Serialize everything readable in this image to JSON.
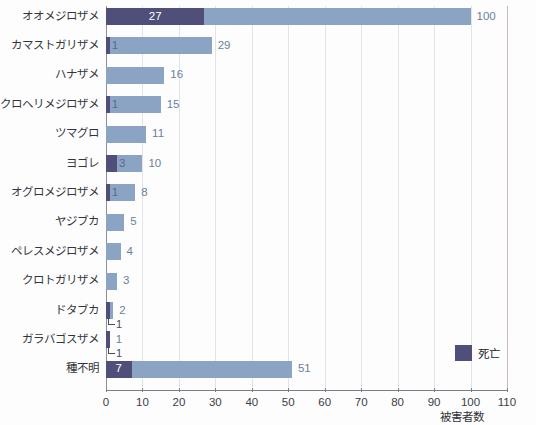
{
  "chart_data": {
    "type": "bar",
    "orientation": "horizontal",
    "stacked_overlay": true,
    "title": "",
    "subtitle": "",
    "xlabel": "被害者数",
    "ylabel": "",
    "xlim": [
      0,
      110
    ],
    "xticks": [
      0,
      10,
      20,
      30,
      40,
      50,
      60,
      70,
      80,
      90,
      100,
      110
    ],
    "xtick_labels": [
      "0",
      "10",
      "20",
      "30",
      "40",
      "50",
      "60",
      "70",
      "80",
      "90",
      "100",
      "110"
    ],
    "grid": "vertical",
    "legend_position": "inside-bottom-right",
    "legend": [
      {
        "name": "死亡",
        "color": "#4f4f79"
      }
    ],
    "categories": [
      "オオメジロザメ",
      "カマストガリザメ",
      "ハナザメ",
      "クロヘリメジロザメ",
      "ツマグロ",
      "ヨゴレ",
      "オグロメジロザメ",
      "ヤジブカ",
      "ペレスメジロザメ",
      "クロトガリザメ",
      "ドタブカ",
      "ガラバゴスザメ",
      "種不明"
    ],
    "series": [
      {
        "name": "被害者数",
        "color": "#8ba4c4",
        "values": [
          100,
          29,
          16,
          15,
          11,
          10,
          8,
          5,
          4,
          3,
          2,
          1,
          51
        ]
      },
      {
        "name": "死亡",
        "color": "#4f4f79",
        "values": [
          27,
          1,
          0,
          1,
          0,
          3,
          1,
          0,
          0,
          0,
          1,
          1,
          7
        ]
      }
    ],
    "rows": [
      {
        "category": "オオメジロザメ",
        "total": 100,
        "total_label": "100",
        "dead": 27,
        "dead_label": "27",
        "dead_label_style": "inside"
      },
      {
        "category": "カマストガリザメ",
        "total": 29,
        "total_label": "29",
        "dead": 1,
        "dead_label": "1",
        "dead_label_style": "inside"
      },
      {
        "category": "ハナザメ",
        "total": 16,
        "total_label": "16",
        "dead": 0,
        "dead_label": "",
        "dead_label_style": "none"
      },
      {
        "category": "クロヘリメジロザメ",
        "total": 15,
        "total_label": "15",
        "dead": 1,
        "dead_label": "1",
        "dead_label_style": "inside"
      },
      {
        "category": "ツマグロ",
        "total": 11,
        "total_label": "11",
        "dead": 0,
        "dead_label": "",
        "dead_label_style": "none"
      },
      {
        "category": "ヨゴレ",
        "total": 10,
        "total_label": "10",
        "dead": 3,
        "dead_label": "3",
        "dead_label_style": "inside"
      },
      {
        "category": "オグロメジロザメ",
        "total": 8,
        "total_label": "8",
        "dead": 1,
        "dead_label": "1",
        "dead_label_style": "inside"
      },
      {
        "category": "ヤジブカ",
        "total": 5,
        "total_label": "5",
        "dead": 0,
        "dead_label": "",
        "dead_label_style": "none"
      },
      {
        "category": "ペレスメジロザメ",
        "total": 4,
        "total_label": "4",
        "dead": 0,
        "dead_label": "",
        "dead_label_style": "none"
      },
      {
        "category": "クロトガリザメ",
        "total": 3,
        "total_label": "3",
        "dead": 0,
        "dead_label": "",
        "dead_label_style": "none"
      },
      {
        "category": "ドタブカ",
        "total": 2,
        "total_label": "2",
        "dead": 1,
        "dead_label": "1",
        "dead_label_style": "callout"
      },
      {
        "category": "ガラバゴスザメ",
        "total": 1,
        "total_label": "1",
        "dead": 1,
        "dead_label": "1",
        "dead_label_style": "callout"
      },
      {
        "category": "種不明",
        "total": 51,
        "total_label": "51",
        "dead": 7,
        "dead_label": "7",
        "dead_label_style": "inside"
      }
    ],
    "colors": {
      "total_bar": "#8ba4c4",
      "dead_bar": "#4f4f79",
      "gridline": "#dfe3ea",
      "axis": "#7d7f88",
      "value_label": "#6c7f9c",
      "background": "#fdfdfd"
    }
  }
}
